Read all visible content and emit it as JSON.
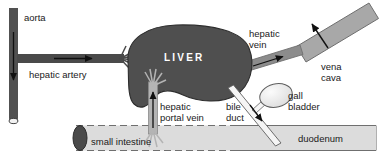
{
  "diagram": {
    "organ_label": "LIVER",
    "labels": {
      "aorta": "aorta",
      "hepatic_artery": "hepatic artery",
      "hepatic_vein_line1": "hepatic",
      "hepatic_vein_line2": "vein",
      "vena_cava_line1": "vena",
      "vena_cava_line2": "cava",
      "hepatic_portal_vein_line1": "hepatic",
      "hepatic_portal_vein_line2": "portal vein",
      "bile_duct_line1": "bile",
      "bile_duct_line2": "duct",
      "gall_bladder_line1": "gall",
      "gall_bladder_line2": "bladder",
      "small_intestine": "small intestine",
      "duodenum": "duodenum"
    },
    "colors": {
      "background": "#ffffff",
      "liver_fill": "#4f4f4f",
      "liver_stroke": "#2b2b2b",
      "aorta_fill": "#515151",
      "hepatic_artery_fill": "#4a4a4a",
      "hepatic_vein_fill": "#8c8c8c",
      "vena_cava_fill": "#a8a8a8",
      "portal_vein_fill": "#b4b4b4",
      "bile_duct_fill": "#f2f2f2",
      "gall_bladder_fill": "#e6e6e6",
      "intestine_fill": "#dcdcdc",
      "intestine_cap_fill": "#4a4a4a",
      "text": "#1a1a1a",
      "organ_text": "#ffffff",
      "outline": "#333333"
    },
    "flow_arrows": [
      {
        "name": "aorta-flow",
        "direction": "down"
      },
      {
        "name": "hepatic-artery-flow",
        "direction": "right"
      },
      {
        "name": "hepatic-vein-flow",
        "direction": "up-right"
      },
      {
        "name": "vena-cava-flow",
        "direction": "up-left"
      },
      {
        "name": "hepatic-portal-vein-flow",
        "direction": "up"
      },
      {
        "name": "bile-duct-flow",
        "direction": "down-right"
      }
    ]
  }
}
